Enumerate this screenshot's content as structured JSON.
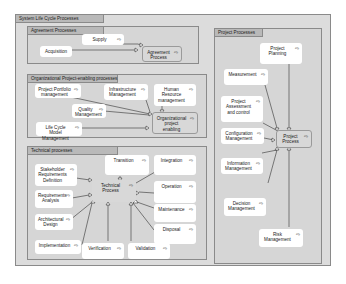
{
  "diagram": {
    "title": "System Life Cycle Processes",
    "packages": {
      "agreement": {
        "title": "Agreement Processes",
        "nodes": {
          "supply": "Supply",
          "acquisition": "Acquisition",
          "agreement_process": "Agreement\nProcess"
        }
      },
      "organizational": {
        "title": "Organizational Project-enabling processes",
        "nodes": {
          "portfolio": "Project Portfolio\nmanagement",
          "infrastructure": "Infrastructure\nManagement",
          "human_resource": "Human\nResource\nmanagement",
          "quality": "Quality\nManagement",
          "life_cycle_model": "Life Cycle Model\nManagement",
          "org_enabling": "Organizational\nproject\nenabling"
        }
      },
      "technical": {
        "title": "Technical processes",
        "nodes": {
          "stakeholder": "Stakeholder\nRequirements\nDefinition",
          "transition": "Transition",
          "integration": "Integration",
          "technical_process": "Technical\nProcess",
          "operation": "Operation",
          "requirements_analysis": "Requirements\nAnalysis",
          "maintenance": "Maintenance",
          "architectural_design": "Architectural\nDesign",
          "disposal": "Disposal",
          "implementation": "Implementation",
          "verification": "Verification",
          "validation": "Validation"
        }
      },
      "project": {
        "title": "Project Processes",
        "nodes": {
          "planning": "Project\nPlanning",
          "measurement": "Measurement",
          "assessment": "Project\nAssessment\nand control",
          "configuration": "Configuration\nManagement",
          "project_process": "Project\nProcess",
          "information": "Information\nManagement",
          "decision": "Decision\nManagement",
          "risk": "Risk\nManagement"
        }
      }
    },
    "node_icon": "link-arrow-icon",
    "icon_glyph": "⇨"
  }
}
